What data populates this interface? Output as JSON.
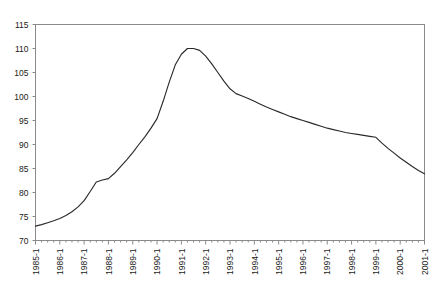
{
  "chart_data": {
    "type": "line",
    "title": "",
    "xlabel": "",
    "ylabel": "",
    "ylim": [
      70,
      115
    ],
    "ytick_step": 5,
    "yticks": [
      70,
      75,
      80,
      85,
      90,
      95,
      100,
      105,
      110,
      115
    ],
    "grid": false,
    "legend": null,
    "x_tick_labels": [
      "1985-1",
      "1986-1",
      "1987-1",
      "1988-1",
      "1989-1",
      "1990-1",
      "1991-1",
      "1992-1",
      "1993-1",
      "1994-1",
      "1995-1",
      "1996-1",
      "1997-1",
      "1998-1",
      "1999-1",
      "2000-1",
      "2001-1"
    ],
    "x_tick_label_rotation": -90,
    "minor_ticks_per_label": 4,
    "x": [
      "1985-1",
      "1985-2",
      "1985-3",
      "1985-4",
      "1986-1",
      "1986-2",
      "1986-3",
      "1986-4",
      "1987-1",
      "1987-2",
      "1987-3",
      "1987-4",
      "1988-1",
      "1988-2",
      "1988-3",
      "1988-4",
      "1989-1",
      "1989-2",
      "1989-3",
      "1989-4",
      "1990-1",
      "1990-2",
      "1990-3",
      "1990-4",
      "1991-1",
      "1991-2",
      "1991-3",
      "1991-4",
      "1992-1",
      "1992-2",
      "1992-3",
      "1992-4",
      "1993-1",
      "1993-2",
      "1993-3",
      "1993-4",
      "1994-1",
      "1994-2",
      "1994-3",
      "1994-4",
      "1995-1",
      "1995-2",
      "1995-3",
      "1995-4",
      "1996-1",
      "1996-2",
      "1996-3",
      "1996-4",
      "1997-1",
      "1997-2",
      "1997-3",
      "1997-4",
      "1998-1",
      "1998-2",
      "1998-3",
      "1998-4",
      "1999-1",
      "1999-2",
      "1999-3",
      "1999-4",
      "2000-1",
      "2000-2",
      "2000-3",
      "2000-4",
      "2001-1"
    ],
    "values": [
      73.0,
      73.3,
      73.7,
      74.1,
      74.6,
      75.2,
      76.0,
      77.0,
      78.3,
      80.2,
      82.2,
      82.6,
      82.9,
      84.0,
      85.4,
      86.8,
      88.3,
      90.0,
      91.6,
      93.4,
      95.4,
      99.0,
      103.0,
      106.6,
      108.8,
      110.0,
      110.0,
      109.6,
      108.4,
      106.8,
      105.0,
      103.2,
      101.6,
      100.6,
      100.1,
      99.6,
      99.0,
      98.4,
      97.8,
      97.3,
      96.8,
      96.3,
      95.8,
      95.4,
      95.0,
      94.6,
      94.2,
      93.8,
      93.4,
      93.1,
      92.8,
      92.5,
      92.3,
      92.1,
      91.9,
      91.7,
      91.5,
      90.3,
      89.2,
      88.2,
      87.2,
      86.3,
      85.4,
      84.6,
      83.9
    ],
    "series": [
      {
        "name": "index",
        "color": "#2b2b2b"
      }
    ]
  },
  "axes": {
    "frame_color": "#8a8a8a"
  }
}
